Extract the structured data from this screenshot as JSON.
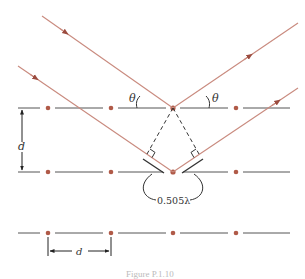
{
  "figure": {
    "caption": "Figure P.1.10",
    "colors": {
      "ray": "#c98a7e",
      "arrowhead": "#9b4b3e",
      "atom": "#b05a48",
      "plane_line": "#555555",
      "construction": "#333333"
    },
    "labels": {
      "theta_incident": "θ",
      "theta_reflected": "θ",
      "plane_spacing": "d",
      "atom_spacing": "d",
      "path_difference": "0.505λ"
    },
    "planes": [
      {
        "name": "top-plane",
        "atoms": 4
      },
      {
        "name": "middle-plane",
        "atoms": 4
      },
      {
        "name": "bottom-plane",
        "atoms": 4
      }
    ]
  }
}
